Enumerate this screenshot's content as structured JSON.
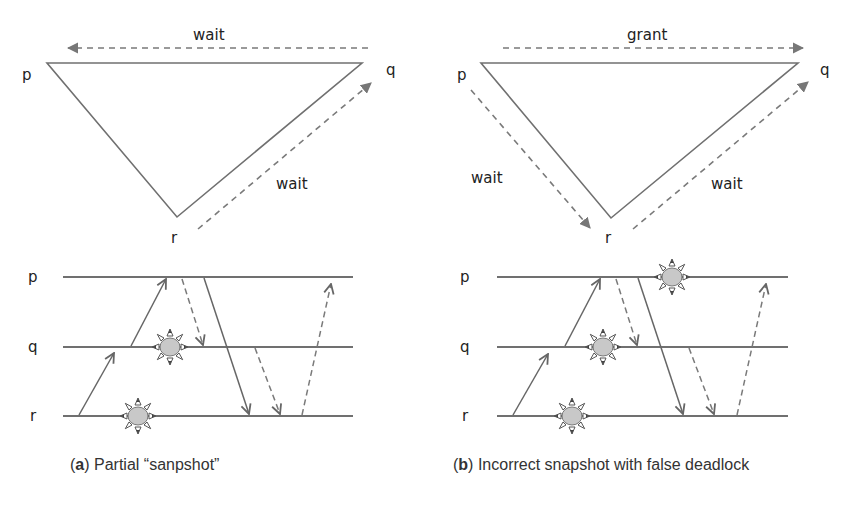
{
  "panels": [
    {
      "id": "a",
      "caption_letter": "a",
      "caption_text": " Partial “sanpshot”",
      "graph": {
        "nodes": [
          "p",
          "q",
          "r"
        ],
        "edges": [
          {
            "from": "q",
            "to": "p",
            "label": "wait",
            "style": "dashed"
          },
          {
            "from": "r",
            "to": "q",
            "label": "wait",
            "style": "dashed"
          }
        ]
      },
      "timeline": {
        "processes": [
          "p",
          "q",
          "r"
        ]
      }
    },
    {
      "id": "b",
      "caption_letter": "b",
      "caption_text": " Incorrect snapshot with false deadlock",
      "graph": {
        "nodes": [
          "p",
          "q",
          "r"
        ],
        "edges": [
          {
            "from": "p",
            "to": "q",
            "label": "grant",
            "style": "dashed"
          },
          {
            "from": "p",
            "to": "r",
            "label": "wait",
            "style": "dashed"
          },
          {
            "from": "r",
            "to": "q",
            "label": "wait",
            "style": "dashed"
          }
        ]
      },
      "timeline": {
        "processes": [
          "p",
          "q",
          "r"
        ]
      }
    }
  ],
  "labels": {
    "a_wait_top": "wait",
    "a_wait_right": "wait",
    "b_grant_top": "grant",
    "b_wait_left": "wait",
    "b_wait_right": "wait",
    "p": "p",
    "q": "q",
    "r": "r"
  },
  "colors": {
    "line": "#707070",
    "dash": "#7a7a7a",
    "snapshot_fill": "#c8c8c8"
  }
}
